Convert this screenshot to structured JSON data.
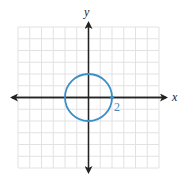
{
  "chart_data": {
    "type": "line",
    "title": "",
    "xlabel": "x",
    "ylabel": "y",
    "xlim": [
      -6,
      6
    ],
    "ylim": [
      -6,
      6
    ],
    "grid": true,
    "series": [
      {
        "name": "circle",
        "shape": "circle",
        "center": [
          0,
          0
        ],
        "radius": 2,
        "equation": "x^2 + y^2 = 4",
        "color": "#3a8fc9"
      }
    ],
    "annotations": [
      {
        "text": "2",
        "x": 2,
        "y": 0,
        "marked_point": true
      }
    ]
  },
  "axes": {
    "x_label": "x",
    "y_label": "y"
  },
  "labels": {
    "radius_label": "2"
  },
  "colors": {
    "curve": "#3a8fc9",
    "axis": "#222222",
    "grid": "#e2e2e2"
  }
}
